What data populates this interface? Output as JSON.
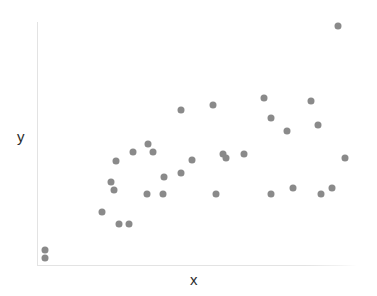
{
  "chart_data": {
    "type": "scatter",
    "title": "",
    "xlabel": "x",
    "ylabel": "y",
    "grid": false,
    "legend": null,
    "marker": {
      "shape": "circle",
      "color": "#8a8a8a",
      "size_px": 7
    },
    "axis": {
      "spine_color": "#e3e3e3",
      "xlim": [
        0,
        1
      ],
      "ylim": [
        0,
        1
      ],
      "ticks_visible": false,
      "tick_labels": []
    },
    "n_points": 33,
    "points": [
      {
        "x": 0.022,
        "y": 0.033
      },
      {
        "x": 0.022,
        "y": 0.066
      },
      {
        "x": 0.202,
        "y": 0.221
      },
      {
        "x": 0.255,
        "y": 0.172
      },
      {
        "x": 0.287,
        "y": 0.172
      },
      {
        "x": 0.23,
        "y": 0.344
      },
      {
        "x": 0.24,
        "y": 0.311
      },
      {
        "x": 0.246,
        "y": 0.43
      },
      {
        "x": 0.3,
        "y": 0.467
      },
      {
        "x": 0.347,
        "y": 0.5
      },
      {
        "x": 0.363,
        "y": 0.467
      },
      {
        "x": 0.345,
        "y": 0.295
      },
      {
        "x": 0.397,
        "y": 0.365
      },
      {
        "x": 0.451,
        "y": 0.381
      },
      {
        "x": 0.394,
        "y": 0.295
      },
      {
        "x": 0.486,
        "y": 0.434
      },
      {
        "x": 0.451,
        "y": 0.639
      },
      {
        "x": 0.552,
        "y": 0.66
      },
      {
        "x": 0.561,
        "y": 0.295
      },
      {
        "x": 0.584,
        "y": 0.459
      },
      {
        "x": 0.593,
        "y": 0.443
      },
      {
        "x": 0.65,
        "y": 0.459
      },
      {
        "x": 0.713,
        "y": 0.688
      },
      {
        "x": 0.735,
        "y": 0.607
      },
      {
        "x": 0.785,
        "y": 0.553
      },
      {
        "x": 0.804,
        "y": 0.32
      },
      {
        "x": 0.86,
        "y": 0.676
      },
      {
        "x": 0.883,
        "y": 0.578
      },
      {
        "x": 0.893,
        "y": 0.295
      },
      {
        "x": 0.928,
        "y": 0.32
      },
      {
        "x": 0.969,
        "y": 0.443
      },
      {
        "x": 0.946,
        "y": 0.984
      },
      {
        "x": 0.735,
        "y": 0.295
      }
    ]
  },
  "figure": {
    "width": 377,
    "height": 296,
    "background": "#ffffff"
  }
}
